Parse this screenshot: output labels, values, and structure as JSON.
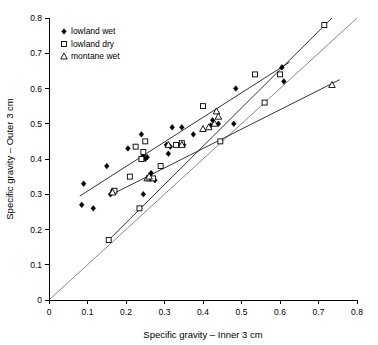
{
  "chart_data": {
    "type": "scatter",
    "title": "",
    "xlabel": "Specific gravity – Inner 3 cm",
    "ylabel": "Specific gravity – Outer 3 cm",
    "xlim": [
      0,
      0.8
    ],
    "ylim": [
      0,
      0.8
    ],
    "xticks": [
      "0",
      "0.1",
      "0.2",
      "0.3",
      "0.4",
      "0.5",
      "0.6",
      "0.7",
      "0.8"
    ],
    "yticks": [
      "0",
      "0.1",
      "0.2",
      "0.3",
      "0.4",
      "0.5",
      "0.6",
      "0.7",
      "0.8"
    ],
    "xtick_values": [
      0,
      0.1,
      0.2,
      0.3,
      0.4,
      0.5,
      0.6,
      0.7,
      0.8
    ],
    "ytick_values": [
      0,
      0.1,
      0.2,
      0.3,
      0.4,
      0.5,
      0.6,
      0.7,
      0.8
    ],
    "grid": false,
    "legend_position": "top-left",
    "marker_color": "#000000",
    "series": [
      {
        "name": "lowland wet",
        "marker": "filled-diamond",
        "points": [
          [
            0.085,
            0.27
          ],
          [
            0.09,
            0.33
          ],
          [
            0.115,
            0.26
          ],
          [
            0.15,
            0.38
          ],
          [
            0.16,
            0.3
          ],
          [
            0.165,
            0.31
          ],
          [
            0.205,
            0.43
          ],
          [
            0.24,
            0.47
          ],
          [
            0.245,
            0.41
          ],
          [
            0.245,
            0.3
          ],
          [
            0.25,
            0.4
          ],
          [
            0.255,
            0.405
          ],
          [
            0.265,
            0.36
          ],
          [
            0.275,
            0.34
          ],
          [
            0.305,
            0.44
          ],
          [
            0.31,
            0.415
          ],
          [
            0.315,
            0.435
          ],
          [
            0.32,
            0.49
          ],
          [
            0.345,
            0.49
          ],
          [
            0.35,
            0.44
          ],
          [
            0.375,
            0.47
          ],
          [
            0.42,
            0.495
          ],
          [
            0.425,
            0.51
          ],
          [
            0.44,
            0.5
          ],
          [
            0.48,
            0.5
          ],
          [
            0.485,
            0.6
          ],
          [
            0.605,
            0.66
          ],
          [
            0.61,
            0.62
          ]
        ],
        "fit_line": {
          "x1": 0.08,
          "y1": 0.295,
          "x2": 0.625,
          "y2": 0.675
        }
      },
      {
        "name": "lowland dry",
        "marker": "open-square",
        "points": [
          [
            0.155,
            0.17
          ],
          [
            0.17,
            0.31
          ],
          [
            0.21,
            0.35
          ],
          [
            0.225,
            0.435
          ],
          [
            0.235,
            0.26
          ],
          [
            0.24,
            0.4
          ],
          [
            0.245,
            0.42
          ],
          [
            0.25,
            0.45
          ],
          [
            0.26,
            0.345
          ],
          [
            0.27,
            0.345
          ],
          [
            0.29,
            0.38
          ],
          [
            0.33,
            0.44
          ],
          [
            0.345,
            0.445
          ],
          [
            0.4,
            0.55
          ],
          [
            0.445,
            0.45
          ],
          [
            0.535,
            0.64
          ],
          [
            0.56,
            0.56
          ],
          [
            0.6,
            0.64
          ],
          [
            0.715,
            0.78
          ]
        ],
        "fit_line": {
          "x1": 0.155,
          "y1": 0.17,
          "x2": 0.735,
          "y2": 0.8
        }
      },
      {
        "name": "montane wet",
        "marker": "open-triangle",
        "points": [
          [
            0.165,
            0.305
          ],
          [
            0.255,
            0.345
          ],
          [
            0.26,
            0.35
          ],
          [
            0.31,
            0.44
          ],
          [
            0.345,
            0.44
          ],
          [
            0.4,
            0.485
          ],
          [
            0.415,
            0.49
          ],
          [
            0.43,
            0.5
          ],
          [
            0.435,
            0.535
          ],
          [
            0.44,
            0.52
          ],
          [
            0.735,
            0.61
          ]
        ],
        "fit_line": {
          "x1": 0.155,
          "y1": 0.295,
          "x2": 0.755,
          "y2": 0.625
        }
      }
    ],
    "reference_line": {
      "name": "1:1 line",
      "x1": 0.0,
      "y1": 0.0,
      "x2": 0.8,
      "y2": 0.8
    }
  },
  "legend": {
    "entries": [
      {
        "label": "lowland wet",
        "marker": "filled-diamond"
      },
      {
        "label": "lowland dry",
        "marker": "open-square"
      },
      {
        "label": "montane wet",
        "marker": "open-triangle"
      }
    ]
  },
  "axes": {
    "x_title": "Specific gravity – Inner 3 cm",
    "y_title": "Specific gravity – Outer 3 cm"
  }
}
